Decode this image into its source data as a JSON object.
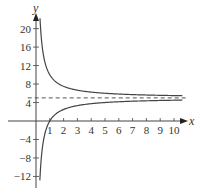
{
  "chart_data": {
    "type": "line",
    "title": "",
    "xlabel": "x",
    "ylabel": "y",
    "xlim": [
      0,
      10.6
    ],
    "ylim": [
      -14,
      22
    ],
    "x_ticks": [
      1,
      2,
      3,
      4,
      5,
      6,
      7,
      8,
      9,
      10
    ],
    "y_ticks": [
      20,
      16,
      12,
      8,
      4,
      -4,
      -8,
      -12
    ],
    "x_tick_labels": [
      "1",
      "2",
      "3",
      "4",
      "5",
      "6",
      "7",
      "8",
      "9",
      "10"
    ],
    "y_tick_labels": [
      "20",
      "16",
      "12",
      "8",
      "4",
      "−4",
      "−8",
      "−12"
    ],
    "grid": false,
    "series": [
      {
        "name": "upper branch",
        "formula": "y = 5 + 5/x",
        "x": [
          0.25,
          0.5,
          1,
          2,
          3,
          4,
          5,
          6,
          7,
          8,
          9,
          10,
          10.5
        ],
        "values": [
          25,
          15,
          10,
          7.5,
          6.67,
          6.25,
          6,
          5.83,
          5.71,
          5.63,
          5.56,
          5.5,
          5.48
        ],
        "color": "#555555",
        "style": "solid"
      },
      {
        "name": "lower branch",
        "formula": "y = 5 - 5/x",
        "x": [
          0.35,
          0.5,
          1,
          2,
          3,
          4,
          5,
          6,
          7,
          8,
          9,
          10,
          10.5
        ],
        "values": [
          -9.29,
          -5,
          0,
          2.5,
          3.33,
          3.75,
          4,
          4.17,
          4.29,
          4.38,
          4.44,
          4.5,
          4.52
        ],
        "color": "#555555",
        "style": "solid"
      },
      {
        "name": "horizontal asymptote",
        "formula": "y = 5",
        "x": [
          0,
          10.5
        ],
        "values": [
          5,
          5
        ],
        "color": "#555555",
        "style": "dashed"
      }
    ]
  }
}
